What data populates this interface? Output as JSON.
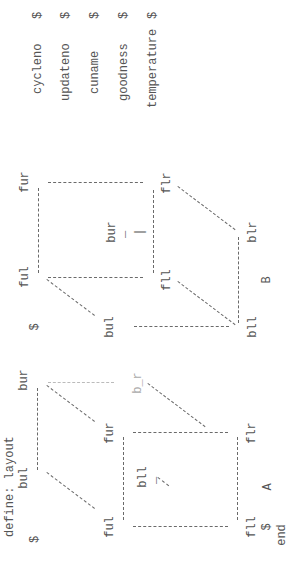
{
  "document": {
    "header": "define: layout",
    "footer_marker": "$",
    "end": "end",
    "cubes": [
      {
        "name": "A",
        "corners": {
          "back_upper_left": "bul",
          "back_upper_right": "bur",
          "front_upper_left": "ful",
          "front_upper_right": "fur",
          "back_lower_left": "bll",
          "back_lower_right": "b_r",
          "front_lower_left": "fll",
          "front_lower_right": "flr"
        },
        "marker": "$",
        "hidden_tick": "_"
      },
      {
        "name": "B",
        "corners": {
          "front_upper_left": "ful",
          "front_upper_right": "fur",
          "back_upper_left": "bul",
          "back_upper_right": "bur",
          "front_lower_left": "fll",
          "front_lower_right": "flr",
          "back_lower_left": "bll",
          "back_lower_right": "blr"
        },
        "marker": "$",
        "hidden_tick": "_",
        "hidden_bar": "|"
      }
    ],
    "fields": [
      {
        "name": "cycleno",
        "marker": "$"
      },
      {
        "name": "updateno",
        "marker": "$"
      },
      {
        "name": "cuname",
        "marker": "$"
      },
      {
        "name": "goodness",
        "marker": "$"
      },
      {
        "name": "temperature",
        "marker": "$"
      }
    ]
  }
}
